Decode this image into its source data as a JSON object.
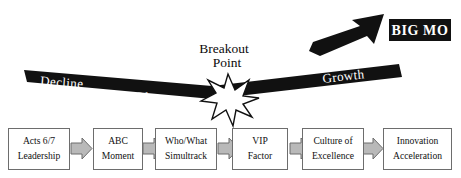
{
  "diagram": {
    "title_hidden": "",
    "momentum_band": {
      "segments": [
        {
          "label": "Decline",
          "phase": "declining"
        },
        {
          "label": "or",
          "phase": "transition"
        },
        {
          "label": "Plateau",
          "phase": "flat"
        },
        {
          "label": "Growth",
          "phase": "rising"
        }
      ]
    },
    "breakout": {
      "line1": "Breakout",
      "line2": "Point",
      "marker": "starburst"
    },
    "big_mo": {
      "label": "BIG MO"
    },
    "arrow": {
      "name": "momentum-arrow",
      "direction": "up-right"
    },
    "colors": {
      "band": "#111111",
      "band_text": "#ffffff",
      "bigmo_box": "#111111",
      "bigmo_text": "#ffffff",
      "box_border": "#6d6d6d",
      "box_fill": "#ffffff",
      "chevron_fill": "#b9b9b9",
      "chevron_stroke": "#6d6d6d",
      "text": "#111111"
    },
    "stages": [
      {
        "line1": "Acts 6/7",
        "line2": "Leadership"
      },
      {
        "line1": "ABC",
        "line2": "Moment"
      },
      {
        "line1": "Who/What",
        "line2": "Simultrack"
      },
      {
        "line1": "VIP",
        "line2": "Factor"
      },
      {
        "line1": "Culture of",
        "line2": "Excellence"
      },
      {
        "line1": "Innovation",
        "line2": "Acceleration"
      }
    ]
  }
}
